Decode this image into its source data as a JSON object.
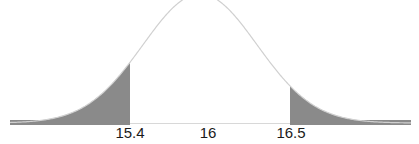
{
  "chart_data": {
    "type": "area",
    "title": "",
    "xlabel": "",
    "ylabel": "",
    "distribution": "normal",
    "mean": 16,
    "tick_labels": [
      "15.4",
      "16",
      "16.5"
    ],
    "tick_values": [
      15.4,
      16,
      16.5
    ],
    "shaded_regions": [
      {
        "name": "left-tail",
        "from": "-inf",
        "to": 15.4
      },
      {
        "name": "right-tail",
        "from": 16.5,
        "to": "+inf"
      }
    ],
    "grid": false,
    "legend": null,
    "colors": {
      "curve": "#d0d0d0",
      "tail_fill": "#8a8a8a",
      "baseline": "#d8d8d8"
    }
  },
  "labels": {
    "left_cutoff": "15.4",
    "mean": "16",
    "right_cutoff": "16.5"
  }
}
